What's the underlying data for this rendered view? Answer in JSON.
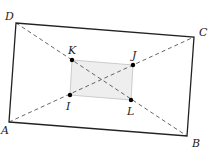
{
  "diagram": {
    "type": "geometry",
    "outer_vertices": [
      {
        "label": "A",
        "x": 9,
        "y": 122,
        "lx": 1,
        "ly": 134
      },
      {
        "label": "B",
        "x": 187,
        "y": 136,
        "lx": 192,
        "ly": 147
      },
      {
        "label": "C",
        "x": 194,
        "y": 37,
        "lx": 199,
        "ly": 36
      },
      {
        "label": "D",
        "x": 16,
        "y": 23,
        "lx": 5,
        "ly": 20
      }
    ],
    "inner_points": [
      {
        "label": "K",
        "x": 72,
        "y": 60,
        "lx": 68,
        "ly": 54
      },
      {
        "label": "J",
        "x": 133,
        "y": 65,
        "lx": 132,
        "ly": 59
      },
      {
        "label": "L",
        "x": 131,
        "y": 100,
        "lx": 127,
        "ly": 115
      },
      {
        "label": "I",
        "x": 70,
        "y": 95,
        "lx": 66,
        "ly": 110
      }
    ],
    "diagonals": [
      {
        "from": "A",
        "to": "C",
        "style": "dashed"
      },
      {
        "from": "D",
        "to": "B",
        "style": "dashed"
      }
    ],
    "colors": {
      "outline": "#222222",
      "dashed": "#555555",
      "inner_fill": "#eeeeee",
      "inner_stroke": "#cccccc",
      "point": "#000000"
    }
  }
}
